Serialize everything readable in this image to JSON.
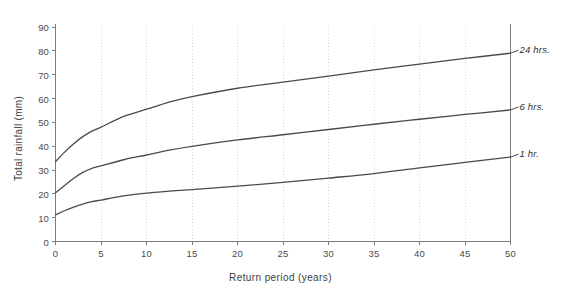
{
  "chart_data": {
    "type": "line",
    "title": "",
    "subtitle": "",
    "xlabel": "Return  period  (years)",
    "ylabel": "Total  rainfall  (mm)",
    "xlim": [
      0,
      50
    ],
    "ylim": [
      0,
      90
    ],
    "xticks": [
      0,
      5,
      10,
      15,
      20,
      25,
      30,
      35,
      40,
      45,
      50
    ],
    "yticks": [
      0,
      10,
      20,
      30,
      40,
      50,
      60,
      70,
      80,
      90
    ],
    "xtick_labels": [
      "0",
      "5",
      "10",
      "15",
      "20",
      "25",
      "30",
      "35",
      "40",
      "45",
      "50"
    ],
    "ytick_labels": [
      "0",
      "10",
      "20",
      "30",
      "40",
      "50",
      "60",
      "70",
      "80",
      "90"
    ],
    "grid": {
      "vertical": true,
      "horizontal": false,
      "style": "dotted",
      "color": "#d8d8d8"
    },
    "legend_position": "inline-right-end-labels",
    "line_color": "#4a4a4a",
    "axis_color": "#7a7a7a",
    "x": [
      0,
      1,
      2,
      3,
      4,
      5,
      7.5,
      10,
      12.5,
      15,
      20,
      25,
      30,
      35,
      40,
      45,
      50
    ],
    "series": [
      {
        "name": "24 hrs.",
        "label": "24 hrs.",
        "values": [
          33.5,
          37.5,
          41.0,
          44.0,
          46.3,
          48.0,
          52.5,
          55.5,
          58.5,
          60.8,
          64.3,
          66.9,
          69.4,
          72.0,
          74.4,
          76.8,
          79.0
        ]
      },
      {
        "name": "6 hrs.",
        "label": "6 hrs.",
        "values": [
          20.5,
          23.5,
          26.5,
          29.0,
          30.7,
          31.7,
          34.3,
          36.3,
          38.3,
          39.9,
          42.6,
          44.8,
          47.0,
          49.2,
          51.3,
          53.3,
          55.2
        ]
      },
      {
        "name": "1 hr.",
        "label": "1 hr.",
        "values": [
          11.2,
          12.9,
          14.4,
          15.7,
          16.7,
          17.4,
          19.1,
          20.3,
          21.1,
          21.8,
          23.2,
          24.8,
          26.6,
          28.5,
          30.9,
          33.2,
          35.4
        ]
      }
    ]
  }
}
